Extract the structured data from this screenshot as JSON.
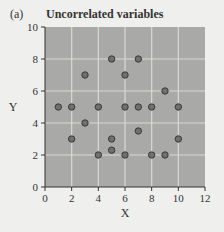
{
  "panel_label": "(a)",
  "title": "Uncorrelated variables",
  "colors": {
    "plot_bg": "#a9a9a7",
    "grid": "#d9d9d6",
    "point_fill": "#6f6f6d",
    "point_stroke": "#3a3a3a",
    "page_bg": "#efefed"
  },
  "chart_data": {
    "type": "scatter",
    "title": "Uncorrelated variables",
    "xlabel": "X",
    "ylabel": "Y",
    "xlim": [
      0,
      12
    ],
    "ylim": [
      0,
      10
    ],
    "xticks": [
      0,
      2,
      4,
      6,
      8,
      10,
      12
    ],
    "yticks": [
      0,
      2,
      4,
      6,
      8,
      10
    ],
    "grid": true,
    "points": [
      {
        "x": 3,
        "y": 7
      },
      {
        "x": 5,
        "y": 8
      },
      {
        "x": 6,
        "y": 7
      },
      {
        "x": 7,
        "y": 8
      },
      {
        "x": 9,
        "y": 6
      },
      {
        "x": 1,
        "y": 5
      },
      {
        "x": 2,
        "y": 5
      },
      {
        "x": 4,
        "y": 5
      },
      {
        "x": 6,
        "y": 5
      },
      {
        "x": 7,
        "y": 5
      },
      {
        "x": 8,
        "y": 5
      },
      {
        "x": 10,
        "y": 5
      },
      {
        "x": 3,
        "y": 4
      },
      {
        "x": 7,
        "y": 3.5
      },
      {
        "x": 2,
        "y": 3
      },
      {
        "x": 5,
        "y": 3
      },
      {
        "x": 10,
        "y": 3
      },
      {
        "x": 5,
        "y": 2.3
      },
      {
        "x": 4,
        "y": 2
      },
      {
        "x": 6,
        "y": 2
      },
      {
        "x": 8,
        "y": 2
      },
      {
        "x": 9,
        "y": 2
      }
    ]
  }
}
